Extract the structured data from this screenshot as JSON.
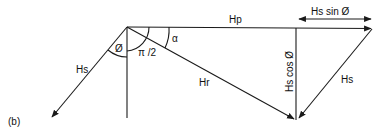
{
  "figure_label": "(b)",
  "labels": {
    "hp": "Hp",
    "hs_sin": "Hs  sin  Ø",
    "hs_cos": "Hs  cos  Ø",
    "hs_left": "Hs",
    "hs_right": "Hs",
    "hr": "Hr",
    "phi": "Ø",
    "pi_half": "π /2",
    "alpha": "α"
  },
  "colors": {
    "stroke": "#1a1a1a",
    "background": "#ffffff"
  }
}
